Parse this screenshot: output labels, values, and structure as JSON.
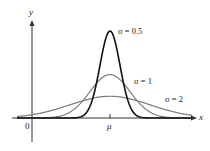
{
  "chart_data": {
    "type": "line",
    "title": "",
    "xlabel": "x",
    "ylabel": "y",
    "x_ticks": [
      {
        "label": "0",
        "value": 0
      },
      {
        "label": "μ",
        "value": "mu"
      }
    ],
    "grid": false,
    "legend": "inline labels next to curves",
    "series": [
      {
        "name": "σ = 0.5",
        "sigma": 0.5,
        "color": "#111111",
        "peak_relative": 1.0
      },
      {
        "name": "σ = 1",
        "sigma": 1,
        "color": "#777777",
        "peak_relative": 0.5
      },
      {
        "name": "σ = 2",
        "sigma": 2,
        "color": "#777777",
        "peak_relative": 0.25
      }
    ],
    "x_range_in_sigma_units": [
      -5,
      4.25
    ]
  },
  "labels": {
    "y_axis": "y",
    "x_axis": "x",
    "origin": "0",
    "mu": "μ",
    "s05": "σ = 0.5",
    "s1": "σ = 1",
    "s2": "σ = 2"
  }
}
